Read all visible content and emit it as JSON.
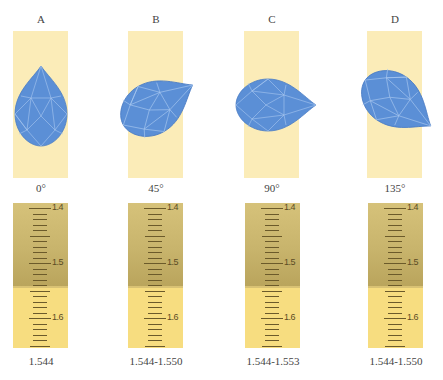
{
  "colors": {
    "gem_panel": "#fbecb8",
    "gem_fill": "#5b8fd6",
    "gem_facet": "#a9c8f0",
    "scale_light": "#f7dd80",
    "scale_shadow": "#c8b46c",
    "tick": "#6b5a2a"
  },
  "panels": [
    {
      "letter": "A",
      "angle": "0°",
      "reading": "1.544",
      "rotation_deg": 0,
      "shadow_edge_ri": 1.544
    },
    {
      "letter": "B",
      "angle": "45°",
      "reading": "1.544-1.550",
      "rotation_deg": 45,
      "shadow_edge_ri": 1.544
    },
    {
      "letter": "C",
      "angle": "90°",
      "reading": "1.544-1.553",
      "rotation_deg": 90,
      "shadow_edge_ri": 1.544
    },
    {
      "letter": "D",
      "angle": "135°",
      "reading": "1.544-1.550",
      "rotation_deg": 135,
      "shadow_edge_ri": 1.544
    }
  ],
  "scale": {
    "labels": [
      "1.4",
      "1.5",
      "1.6"
    ],
    "min": 1.39,
    "max": 1.65,
    "step": 0.01
  }
}
